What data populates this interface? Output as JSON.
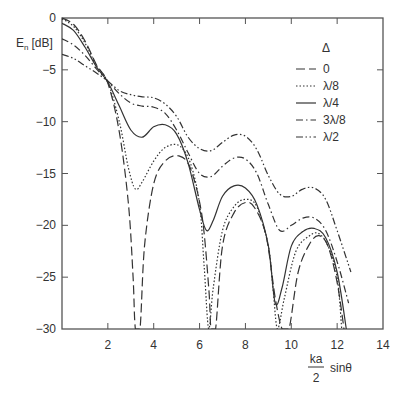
{
  "chart_data": {
    "type": "line",
    "title": "",
    "xlabel": "ka/2 sinθ",
    "xlabel_parts": {
      "numerator": "ka",
      "denominator": "2",
      "suffix": "sinθ"
    },
    "ylabel": "E_n [dB]",
    "ylabel_parts": {
      "main": "E",
      "sub": "n",
      "unit": "[dB]"
    },
    "xlim": [
      0,
      14
    ],
    "ylim": [
      -30,
      0
    ],
    "x_ticks": [
      2,
      4,
      6,
      8,
      10,
      12,
      14
    ],
    "x_tick_labels": [
      "2",
      "4",
      "6",
      "8",
      "10",
      "12",
      "14"
    ],
    "y_ticks": [
      0,
      -5,
      -10,
      -15,
      -20,
      -25,
      -30
    ],
    "y_tick_labels": [
      "0",
      "−5",
      "−10",
      "−15",
      "−20",
      "−25",
      "−30"
    ],
    "grid": false,
    "legend_title": "Δ",
    "legend_position": "upper right",
    "series": [
      {
        "name": "0",
        "style": "dashed",
        "x": [
          0,
          0.5,
          1.0,
          1.5,
          2.0,
          2.5,
          2.9,
          3.1,
          3.2,
          3.4,
          3.6,
          4.0,
          4.5,
          5.1,
          5.6,
          6.1,
          6.4,
          6.5,
          6.7,
          7.0,
          7.5,
          8.0,
          8.4,
          8.9,
          9.3,
          9.6,
          9.9,
          10.3,
          10.8,
          11.2,
          11.6,
          12.0,
          12.3
        ],
        "y": [
          0,
          -0.6,
          -2.2,
          -4.5,
          -6.3,
          -11.0,
          -18.0,
          -25.0,
          -30.0,
          -30.0,
          -22.0,
          -16.0,
          -13.8,
          -13.3,
          -14.5,
          -19.0,
          -26.0,
          -30.0,
          -30.0,
          -22.0,
          -18.8,
          -17.8,
          -18.3,
          -21.0,
          -27.0,
          -30.0,
          -30.0,
          -24.5,
          -21.8,
          -21.0,
          -22.0,
          -25.5,
          -30.0
        ]
      },
      {
        "name": "λ/8",
        "style": "dotted",
        "x": [
          0,
          0.5,
          1.0,
          1.5,
          2.0,
          2.5,
          2.9,
          3.2,
          3.5,
          4.0,
          4.5,
          5.1,
          5.6,
          6.0,
          6.2,
          6.4,
          6.6,
          7.0,
          7.5,
          8.0,
          8.5,
          9.0,
          9.2,
          9.4,
          9.7,
          10.2,
          10.8,
          11.2,
          11.6,
          12.0,
          12.2
        ],
        "y": [
          -0.1,
          -0.8,
          -2.4,
          -4.6,
          -6.2,
          -10.0,
          -14.5,
          -16.5,
          -15.8,
          -13.8,
          -12.5,
          -12.3,
          -14.0,
          -18.0,
          -24.0,
          -30.0,
          -26.0,
          -20.5,
          -18.2,
          -17.5,
          -18.2,
          -22.0,
          -26.0,
          -30.0,
          -27.0,
          -22.5,
          -21.0,
          -20.8,
          -22.0,
          -25.0,
          -30.0
        ]
      },
      {
        "name": "λ/4",
        "style": "solid",
        "x": [
          0,
          0.5,
          1.0,
          1.5,
          2.0,
          2.5,
          3.0,
          3.5,
          4.0,
          4.5,
          5.0,
          5.5,
          6.0,
          6.3,
          6.6,
          7.0,
          7.5,
          8.0,
          8.5,
          9.0,
          9.3,
          9.6,
          10.0,
          10.5,
          11.0,
          11.5,
          12.0,
          12.4
        ],
        "y": [
          -0.5,
          -1.2,
          -2.8,
          -4.7,
          -6.2,
          -8.5,
          -10.8,
          -11.5,
          -10.5,
          -10.3,
          -11.2,
          -14.0,
          -18.5,
          -20.5,
          -19.5,
          -17.2,
          -16.2,
          -16.4,
          -18.0,
          -22.0,
          -27.5,
          -26.0,
          -22.0,
          -20.6,
          -20.3,
          -21.2,
          -24.5,
          -30.0
        ]
      },
      {
        "name": "3λ/8",
        "style": "dashdot",
        "x": [
          0,
          0.5,
          1.0,
          1.5,
          2.0,
          2.5,
          3.0,
          3.5,
          4.0,
          4.5,
          5.0,
          5.5,
          6.0,
          6.5,
          7.0,
          7.5,
          8.0,
          8.5,
          9.0,
          9.5,
          10.0,
          10.5,
          11.0,
          11.5,
          12.0,
          12.5
        ],
        "y": [
          -2.0,
          -2.6,
          -3.6,
          -4.9,
          -6.1,
          -7.3,
          -8.2,
          -8.5,
          -8.6,
          -9.2,
          -10.8,
          -13.0,
          -15.0,
          -15.3,
          -14.3,
          -13.5,
          -13.6,
          -15.0,
          -18.0,
          -20.5,
          -20.0,
          -19.3,
          -19.3,
          -20.5,
          -23.5,
          -27.5
        ]
      },
      {
        "name": "λ/2",
        "style": "dashdotdot",
        "x": [
          0,
          0.5,
          1.0,
          1.5,
          2.0,
          2.5,
          3.0,
          3.5,
          4.0,
          4.5,
          5.0,
          5.5,
          6.0,
          6.5,
          7.0,
          7.5,
          8.0,
          8.5,
          9.0,
          9.5,
          10.0,
          10.5,
          11.0,
          11.5,
          12.0,
          12.6
        ],
        "y": [
          -3.5,
          -3.9,
          -4.6,
          -5.3,
          -6.1,
          -7.0,
          -7.4,
          -7.6,
          -7.7,
          -8.3,
          -9.5,
          -11.5,
          -12.6,
          -12.8,
          -12.0,
          -11.3,
          -11.4,
          -12.7,
          -15.2,
          -17.0,
          -17.2,
          -16.5,
          -16.4,
          -17.5,
          -20.5,
          -24.5
        ]
      }
    ]
  },
  "legend": {
    "title": "Δ",
    "items": [
      {
        "label": "0",
        "style": "dashed"
      },
      {
        "label": "λ/8",
        "style": "dotted"
      },
      {
        "label": "λ/4",
        "style": "solid"
      },
      {
        "label": "3λ/8",
        "style": "dashdot"
      },
      {
        "label": "λ/2",
        "style": "dashdotdot"
      }
    ]
  },
  "colors": {
    "line": "#333333",
    "axis": "#555555",
    "background": "#ffffff"
  }
}
